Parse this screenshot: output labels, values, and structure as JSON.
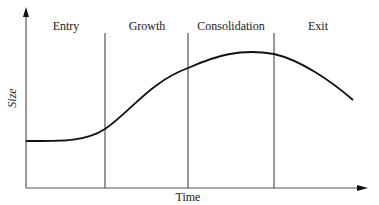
{
  "diagram": {
    "phases": [
      {
        "label": "Entry"
      },
      {
        "label": "Growth"
      },
      {
        "label": "Consolidation"
      },
      {
        "label": "Exit"
      }
    ],
    "x_axis_label": "Time",
    "y_axis_label": "Size",
    "curve": "S-shaped rise from a flat start in Entry, steep growth, peak during Consolidation, decline in Exit",
    "colors": {
      "line": "#111111",
      "divider": "#333333",
      "background": "#ffffff"
    }
  }
}
